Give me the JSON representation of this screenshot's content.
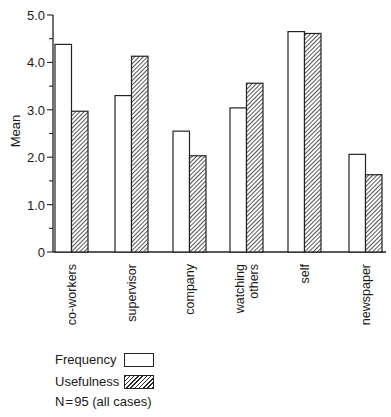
{
  "chart_data": {
    "type": "bar",
    "title": "",
    "xlabel": "",
    "ylabel": "Mean",
    "ylim": [
      0,
      5.0
    ],
    "yticks": [
      "0",
      "1.0",
      "2.0",
      "3.0",
      "4.0",
      "5.0"
    ],
    "grid": false,
    "legend_position": "bottom-left",
    "categories": [
      "co-workers",
      "supervisor",
      "company",
      "watching others",
      "self",
      "newspaper"
    ],
    "category_label_lines": [
      [
        "co-workers"
      ],
      [
        "supervisor"
      ],
      [
        "company"
      ],
      [
        "watching",
        "others"
      ],
      [
        "self"
      ],
      [
        "newspaper"
      ]
    ],
    "series": [
      {
        "name": "Frequency",
        "style": "white",
        "values": [
          4.38,
          3.3,
          2.55,
          3.04,
          4.65,
          2.06
        ]
      },
      {
        "name": "Usefulness",
        "style": "hatched",
        "values": [
          2.97,
          4.13,
          2.03,
          3.56,
          4.61,
          1.63
        ]
      }
    ],
    "annotation": "N=95 (all cases)"
  },
  "legend": {
    "frequency_label": "Frequency",
    "usefulness_label": "Usefulness",
    "note": "N = 95 (all cases)"
  },
  "axis": {
    "ylabel": "Mean"
  }
}
